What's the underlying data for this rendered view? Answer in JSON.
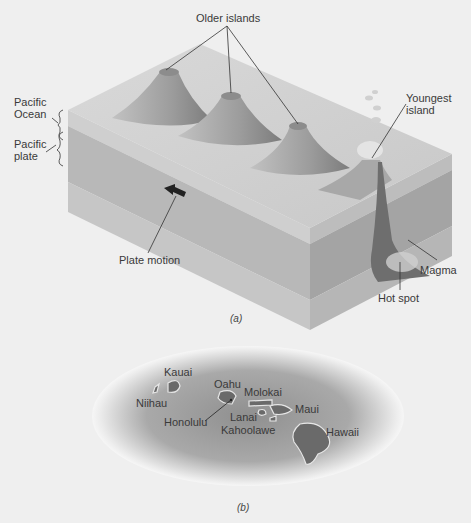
{
  "figure_a": {
    "caption": "(a)",
    "labels": {
      "older_islands": "Older islands",
      "youngest_island_line1": "Youngest",
      "youngest_island_line2": "island",
      "pacific_ocean_line1": "Pacific",
      "pacific_ocean_line2": "Ocean",
      "pacific_plate_line1": "Pacific",
      "pacific_plate_line2": "plate",
      "plate_motion": "Plate motion",
      "magma": "Magma",
      "hot_spot": "Hot spot"
    }
  },
  "figure_b": {
    "caption": "(b)",
    "islands": {
      "kauai": "Kauai",
      "niihau": "Niihau",
      "oahu": "Oahu",
      "honolulu": "Honolulu",
      "molokai": "Molokai",
      "lanai": "Lanai",
      "kahoolawe": "Kahoolawe",
      "maui": "Maui",
      "hawaii": "Hawaii"
    }
  },
  "colors": {
    "background": "#efefef",
    "ocean_top": "#d6d6d6",
    "plate_front": "#b4b4b4",
    "plate_side": "#a0a0a0",
    "volcano": "#9a9a9a",
    "magma": "#6e6e6e",
    "map_ocean": "#a8a8a8",
    "map_island": "#6a6a6a"
  }
}
